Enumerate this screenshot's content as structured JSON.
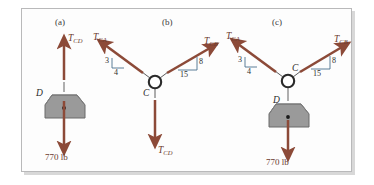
{
  "figure": {
    "background_color": "#fdfdfd",
    "border_color": "#b9b9ba",
    "vector_color": "#8c4a38",
    "block_fill": "#9a9a9a",
    "label_color": "#3a3a3a"
  },
  "panels": [
    {
      "id": "a",
      "label": "(a)",
      "vectors": [
        {
          "name": "T_CD",
          "label_main": "T",
          "label_sub": "CD",
          "direction": "up"
        },
        {
          "name": "load",
          "label": "770 lb",
          "direction": "down"
        }
      ],
      "nodes": [
        {
          "name": "D",
          "label": "D"
        }
      ],
      "load_label": "770 lb"
    },
    {
      "id": "b",
      "label": "(b)",
      "vectors": [
        {
          "name": "T_CA",
          "label_main": "T",
          "label_sub": "CA",
          "direction": "up-left",
          "slope_rise": "3",
          "slope_run": "4"
        },
        {
          "name": "T_CB",
          "label_main": "T",
          "label_sub": "CB",
          "direction": "up-right",
          "slope_rise": "8",
          "slope_run": "15"
        },
        {
          "name": "T_CD",
          "label_main": "T",
          "label_sub": "CD",
          "direction": "down"
        }
      ],
      "nodes": [
        {
          "name": "C",
          "label": "C"
        }
      ]
    },
    {
      "id": "c",
      "label": "(c)",
      "vectors": [
        {
          "name": "T_CA",
          "label_main": "T",
          "label_sub": "CA",
          "direction": "up-left",
          "slope_rise": "3",
          "slope_run": "4"
        },
        {
          "name": "T_CB",
          "label_main": "T",
          "label_sub": "CB",
          "direction": "up-right",
          "slope_rise": "8",
          "slope_run": "15"
        },
        {
          "name": "load",
          "label": "770 lb",
          "direction": "down"
        }
      ],
      "nodes": [
        {
          "name": "C",
          "label": "C"
        },
        {
          "name": "D",
          "label": "D"
        }
      ],
      "load_label": "770 lb"
    }
  ],
  "labels": {
    "panel_a": "(a)",
    "panel_b": "(b)",
    "panel_c": "(c)",
    "T": "T",
    "sub_CD": "CD",
    "sub_CA": "CA",
    "sub_CB": "CB",
    "node_C": "C",
    "node_D": "D",
    "load": "770 lb",
    "three": "3",
    "four": "4",
    "eight": "8",
    "fifteen": "15"
  }
}
